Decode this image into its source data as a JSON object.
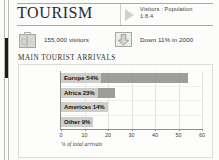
{
  "header": {
    "title": "TOURISM",
    "marker_icon": "triangle-right-icon",
    "ratio_label": "Visitors : Population",
    "ratio_value": "1:8.4"
  },
  "stats": [
    {
      "icon": "suitcase-icon",
      "text": "155,000 visitors"
    },
    {
      "icon": "down-arrow-icon",
      "text": "Down 11% in 2000"
    }
  ],
  "section": {
    "title": "MAIN TOURIST ARRIVALS"
  },
  "chart_data": {
    "type": "bar",
    "orientation": "horizontal",
    "title": "MAIN TOURIST ARRIVALS",
    "categories": [
      "Europe",
      "Africa",
      "Americas",
      "Other"
    ],
    "values": [
      54,
      23,
      14,
      9
    ],
    "bar_labels": [
      "Europe 54%",
      "Africa 23%",
      "Americas 14%",
      "Other 9%"
    ],
    "xlabel": "% of total arrivals",
    "ylabel": "",
    "xlim": [
      0,
      60
    ],
    "xticks": [
      0,
      10,
      20,
      30,
      40,
      50,
      60
    ],
    "xtick_labels": [
      "0",
      "10",
      "20",
      "30",
      "40",
      "50",
      "60"
    ],
    "grid": true,
    "legend": false,
    "bar_color": "#9d9d9a",
    "label_box_color": "#cdcdcb"
  },
  "colors": {
    "paper": "#fcfcfb",
    "rule": "#a8a8a4",
    "text": "#2a2a28",
    "bar": "#9d9d9a"
  }
}
